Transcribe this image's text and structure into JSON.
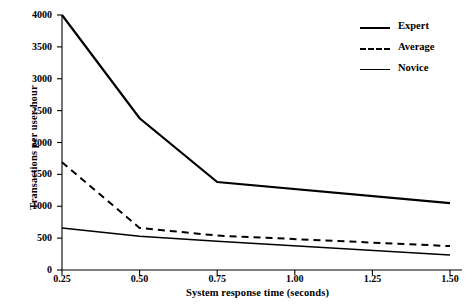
{
  "chart_data": {
    "type": "line",
    "title": "",
    "xlabel": "System response time (seconds)",
    "ylabel": "Transactions per user-hour",
    "xlim": [
      0.25,
      1.5
    ],
    "ylim": [
      0,
      4000
    ],
    "xticks": [
      "0.25",
      "0.50",
      "0.75",
      "1.00",
      "1.25",
      "1.50"
    ],
    "xtick_values": [
      0.25,
      0.5,
      0.75,
      1.0,
      1.25,
      1.5
    ],
    "yticks": [
      "0",
      "500",
      "1000",
      "1500",
      "2000",
      "2500",
      "3000",
      "3500",
      "4000"
    ],
    "ytick_values": [
      0,
      500,
      1000,
      1500,
      2000,
      2500,
      3000,
      3500,
      4000
    ],
    "grid": false,
    "legend_position": "upper right",
    "x": [
      0.25,
      0.5,
      0.75,
      1.5
    ],
    "series": [
      {
        "name": "Expert",
        "style": "solid",
        "width": 2.2,
        "color": "#000000",
        "x": [
          0.25,
          0.5,
          0.75,
          1.5
        ],
        "values": [
          4000,
          2380,
          1380,
          1050
        ]
      },
      {
        "name": "Average",
        "style": "dashed",
        "width": 2.0,
        "color": "#000000",
        "x": [
          0.25,
          0.5,
          0.75,
          1.5
        ],
        "values": [
          1690,
          660,
          540,
          375
        ]
      },
      {
        "name": "Novice",
        "style": "solid",
        "width": 1.6,
        "color": "#000000",
        "x": [
          0.25,
          0.5,
          0.75,
          1.5
        ],
        "values": [
          660,
          530,
          450,
          235
        ]
      }
    ]
  },
  "axes": {
    "ylabel": "Transactions per user-hour",
    "xlabel": "System response time (seconds)"
  },
  "legend": {
    "items": [
      {
        "label": "Expert"
      },
      {
        "label": "Average"
      },
      {
        "label": "Novice"
      }
    ]
  }
}
